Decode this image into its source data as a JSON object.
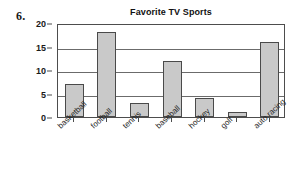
{
  "problem": {
    "number": "6."
  },
  "chart_data": {
    "type": "bar",
    "title": "Favorite TV Sports",
    "xlabel": "",
    "ylabel": "",
    "categories": [
      "basketball",
      "football",
      "tennis",
      "baseball",
      "hockey",
      "golf",
      "auto racing"
    ],
    "values": [
      7,
      18,
      3,
      12,
      4,
      1,
      16
    ],
    "ylim": [
      0,
      20
    ],
    "yticks": [
      0,
      5,
      10,
      15,
      20
    ],
    "ytick_labels": [
      "0",
      "5",
      "10",
      "15",
      "20"
    ],
    "grid": true,
    "grid_axis": "y",
    "legend": false,
    "bar_fill_color": "#c9c9c9",
    "bar_border_color": "#4a4a4a",
    "gridline_color": "#6b6b6b",
    "axis_color": "#4d4d4d",
    "background_color": "#ffffff",
    "xtick_label_rotation": -43
  }
}
